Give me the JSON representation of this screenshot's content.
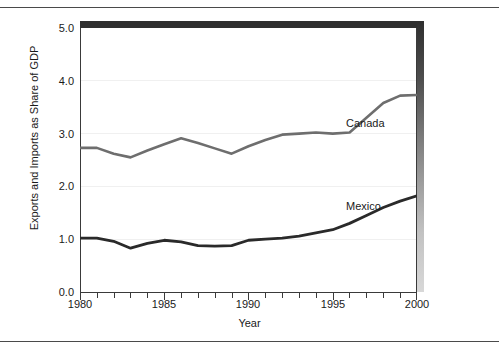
{
  "figure": {
    "has_top_rule": true,
    "has_bottom_rule": true,
    "frame_color": "#2f2f2f",
    "background": "#ffffff"
  },
  "chart_data": {
    "type": "line",
    "title": "",
    "subtitle": "",
    "xlabel": "Year",
    "ylabel": "Exports and Imports as Share of GDP",
    "xlim": [
      1980,
      2000
    ],
    "ylim": [
      0.0,
      5.0
    ],
    "ytick_labels": [
      "0.0",
      "1.0",
      "2.0",
      "3.0",
      "4.0",
      "5.0"
    ],
    "ytick_values": [
      0.0,
      1.0,
      2.0,
      3.0,
      4.0,
      5.0
    ],
    "xtick_labels": [
      "1980",
      "1985",
      "1990",
      "1995",
      "2000"
    ],
    "xtick_values": [
      1980,
      1985,
      1990,
      1995,
      2000
    ],
    "xtick_minor_step": 1,
    "grid": "horizontal-faint",
    "grid_color": "#f0f0f0",
    "legend": "inline-labels",
    "x": [
      1980,
      1981,
      1982,
      1983,
      1984,
      1985,
      1986,
      1987,
      1988,
      1989,
      1990,
      1991,
      1992,
      1993,
      1994,
      1995,
      1996,
      1997,
      1998,
      1999
    ],
    "series": [
      {
        "name": "Canada",
        "color": "#6e6e6e",
        "label_text": "Canada",
        "values": [
          2.73,
          2.73,
          2.63,
          2.55,
          2.68,
          2.8,
          2.91,
          2.83,
          2.73,
          2.62,
          2.74,
          2.83,
          2.92,
          2.96,
          2.97,
          2.96,
          2.94,
          3.0,
          3.18,
          3.45
        ]
      },
      {
        "name": "Mexico",
        "color": "#2a2a2a",
        "label_text": "Mexico",
        "values": [
          1.02,
          1.02,
          0.97,
          0.83,
          0.92,
          0.98,
          0.95,
          0.88,
          0.87,
          0.88,
          0.98,
          1.0,
          1.02,
          1.06,
          1.11,
          1.18,
          1.28,
          1.42,
          1.56,
          1.7
        ]
      }
    ],
    "series_extended": [
      {
        "name": "Canada",
        "points": [
          [
            1980,
            2.73
          ],
          [
            1981,
            2.73
          ],
          [
            1982,
            2.62
          ],
          [
            1983,
            2.55
          ],
          [
            1984,
            2.68
          ],
          [
            1985,
            2.8
          ],
          [
            1986,
            2.91
          ],
          [
            1987,
            2.82
          ],
          [
            1988,
            2.72
          ],
          [
            1989,
            2.62
          ],
          [
            1990,
            2.76
          ],
          [
            1991,
            2.88
          ],
          [
            1992,
            2.98
          ],
          [
            1993,
            3.0
          ],
          [
            1994,
            3.02
          ],
          [
            1995,
            3.0
          ],
          [
            1996,
            3.02
          ],
          [
            1997,
            3.3
          ],
          [
            1998,
            3.58
          ],
          [
            1999,
            3.72
          ],
          [
            2000,
            3.73
          ]
        ]
      },
      {
        "name": "Mexico",
        "points": [
          [
            1980,
            1.02
          ],
          [
            1981,
            1.02
          ],
          [
            1982,
            0.96
          ],
          [
            1983,
            0.83
          ],
          [
            1984,
            0.92
          ],
          [
            1985,
            0.98
          ],
          [
            1986,
            0.95
          ],
          [
            1987,
            0.88
          ],
          [
            1988,
            0.87
          ],
          [
            1989,
            0.88
          ],
          [
            1990,
            0.98
          ],
          [
            1991,
            1.0
          ],
          [
            1992,
            1.02
          ],
          [
            1993,
            1.06
          ],
          [
            1994,
            1.12
          ],
          [
            1995,
            1.18
          ],
          [
            1996,
            1.3
          ],
          [
            1997,
            1.45
          ],
          [
            1998,
            1.6
          ],
          [
            1999,
            1.72
          ],
          [
            2000,
            1.82
          ]
        ]
      }
    ]
  }
}
